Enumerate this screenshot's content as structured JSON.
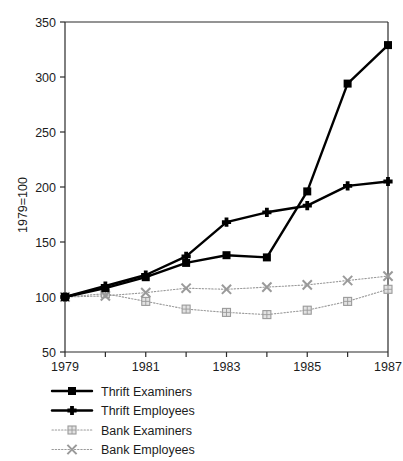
{
  "chart_data": {
    "type": "line",
    "title": "",
    "xlabel": "",
    "ylabel": "1979=100",
    "x": [
      1979,
      1980,
      1981,
      1982,
      1983,
      1984,
      1985,
      1986,
      1987
    ],
    "xtick_labels": [
      "1979",
      "",
      "1981",
      "",
      "1983",
      "",
      "1985",
      "",
      "1987"
    ],
    "xlim": [
      1979,
      1987
    ],
    "ylim": [
      50,
      350
    ],
    "ytick_labels": [
      "50",
      "100",
      "150",
      "200",
      "250",
      "300",
      "350"
    ],
    "yticks": [
      50,
      100,
      150,
      200,
      250,
      300,
      350
    ],
    "grid": false,
    "legend_position": "below-left",
    "series": [
      {
        "name": "Thrift Examiners",
        "values": [
          100,
          108,
          118,
          131,
          138,
          136,
          196,
          294,
          329
        ],
        "color": "#000000",
        "marker": "square",
        "linestyle": "solid"
      },
      {
        "name": "Thrift Employees",
        "values": [
          100,
          110,
          120,
          137,
          168,
          177,
          183,
          201,
          205
        ],
        "color": "#000000",
        "marker": "plus-diamond",
        "linestyle": "solid"
      },
      {
        "name": "Bank Examiners",
        "values": [
          100,
          103,
          96,
          89,
          86,
          84,
          88,
          96,
          107
        ],
        "color": "#9a9a9a",
        "marker": "square-open",
        "linestyle": "dotted"
      },
      {
        "name": "Bank Employees",
        "values": [
          100,
          101,
          104,
          108,
          107,
          109,
          111,
          115,
          119
        ],
        "color": "#9a9a9a",
        "marker": "x-cross",
        "linestyle": "dotted"
      }
    ]
  },
  "axes": {
    "y_axis_label": "1979=100"
  },
  "legend": {
    "items": [
      {
        "label": "Thrift Examiners"
      },
      {
        "label": "Thrift Employees"
      },
      {
        "label": "Bank Examiners"
      },
      {
        "label": "Bank Employees"
      }
    ]
  },
  "colors": {
    "thrift": "#000000",
    "bank": "#9a9a9a",
    "axis": "#2a2a2a",
    "background": "#ffffff"
  }
}
